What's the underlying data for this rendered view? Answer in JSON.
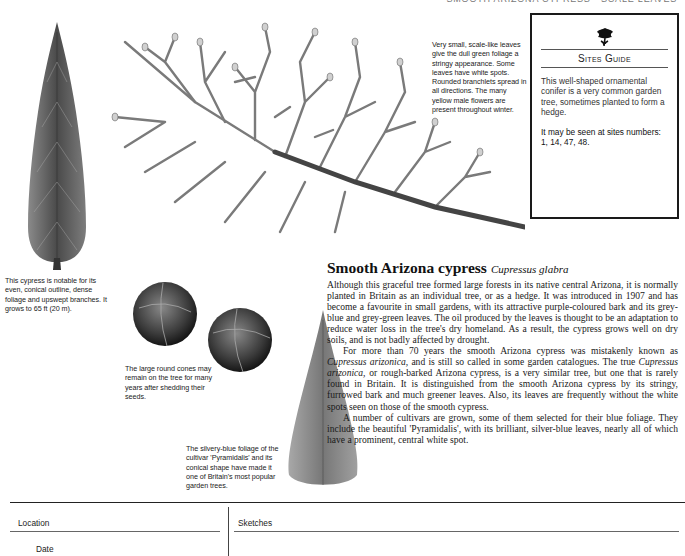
{
  "running_head": "Smooth Arizona Cypress · Scale Leaves",
  "illustrations": {
    "tall_tree": "tall-conical-cypress-illustration",
    "branch": "cypress-branch-illustration",
    "cones": "round-cones-illustration",
    "pyramid_tree": "pyramidalis-cultivar-illustration"
  },
  "captions": {
    "leaves": "Very small, scale-like leaves give the dull green foliage a stringy appearance. Some leaves have white spots. Rounded branchlets spread in all directions. The many yellow male flowers are present throughout winter.",
    "tree": "This cypress is notable for its even, conical outline, dense foliage and upswept branches. It grows to 65 ft (20 m).",
    "cones": "The large round cones may remain on the tree for many years after shedding their seeds.",
    "pyramid": "The silvery-blue foliage of the cultivar 'Pyramidalis' and its conical shape have made it one of Britain's most popular garden trees."
  },
  "sites_guide": {
    "emblem": "oak-leaf-emblem",
    "title": "Sites Guide",
    "description": "This well-shaped ornamental conifer is a very common garden tree, sometimes planted to form a hedge.",
    "sites_text": "It may be seen at sites numbers: 1, 14, 47, 48."
  },
  "article": {
    "title": "Smooth Arizona cypress",
    "latin_name": "Cupressus glabra",
    "paragraphs": [
      "Although this graceful tree formed large forests in its native central Arizona, it is normally planted in Britain as an individual tree, or as a hedge. It was introduced in 1907 and has become a favourite in small gardens, with its attractive purple-coloured bark and its grey-blue and grey-green leaves. The oil produced by the leaves is thought to be an adaptation to reduce water loss in the tree's dry homeland. As a result, the cypress grows well on dry soils, and is not badly affected by drought.",
      "For more than 70 years the smooth Arizona cypress was mistakenly known as Cupressus arizonica, and is still so called in some garden catalogues. The true Cupressus arizonica, or rough-barked Arizona cypress, is a very similar tree, but one that is rarely found in Britain. It is distinguished from the smooth Arizona cypress by its stringy, furrowed bark and much greener leaves. Also, its leaves are frequently without the white spots seen on those of the smooth cypress.",
      "A number of cultivars are grown, some of them selected for their blue foliage. They include the beautiful 'Pyramidalis', with its brilliant, silver-blue leaves, nearly all of which have a prominent, central white spot."
    ],
    "p2_parts": {
      "a": "For more than 70 years the smooth Arizona cypress was mistakenly known as ",
      "i1": "Cupressus arizonica,",
      "b": " and is still so called in some garden catalogues. The true ",
      "i2": "Cupressus arizonica,",
      "c": " or rough-barked Arizona cypress, is a very similar tree, but one that is rarely found in Britain. It is distinguished from the smooth Arizona cypress by its stringy, furrowed bark and much greener leaves. Also, its leaves are frequently without the white spots seen on those of the smooth cypress."
    }
  },
  "notes": {
    "location_label": "Location",
    "date_label": "Date",
    "sketches_label": "Sketches"
  }
}
